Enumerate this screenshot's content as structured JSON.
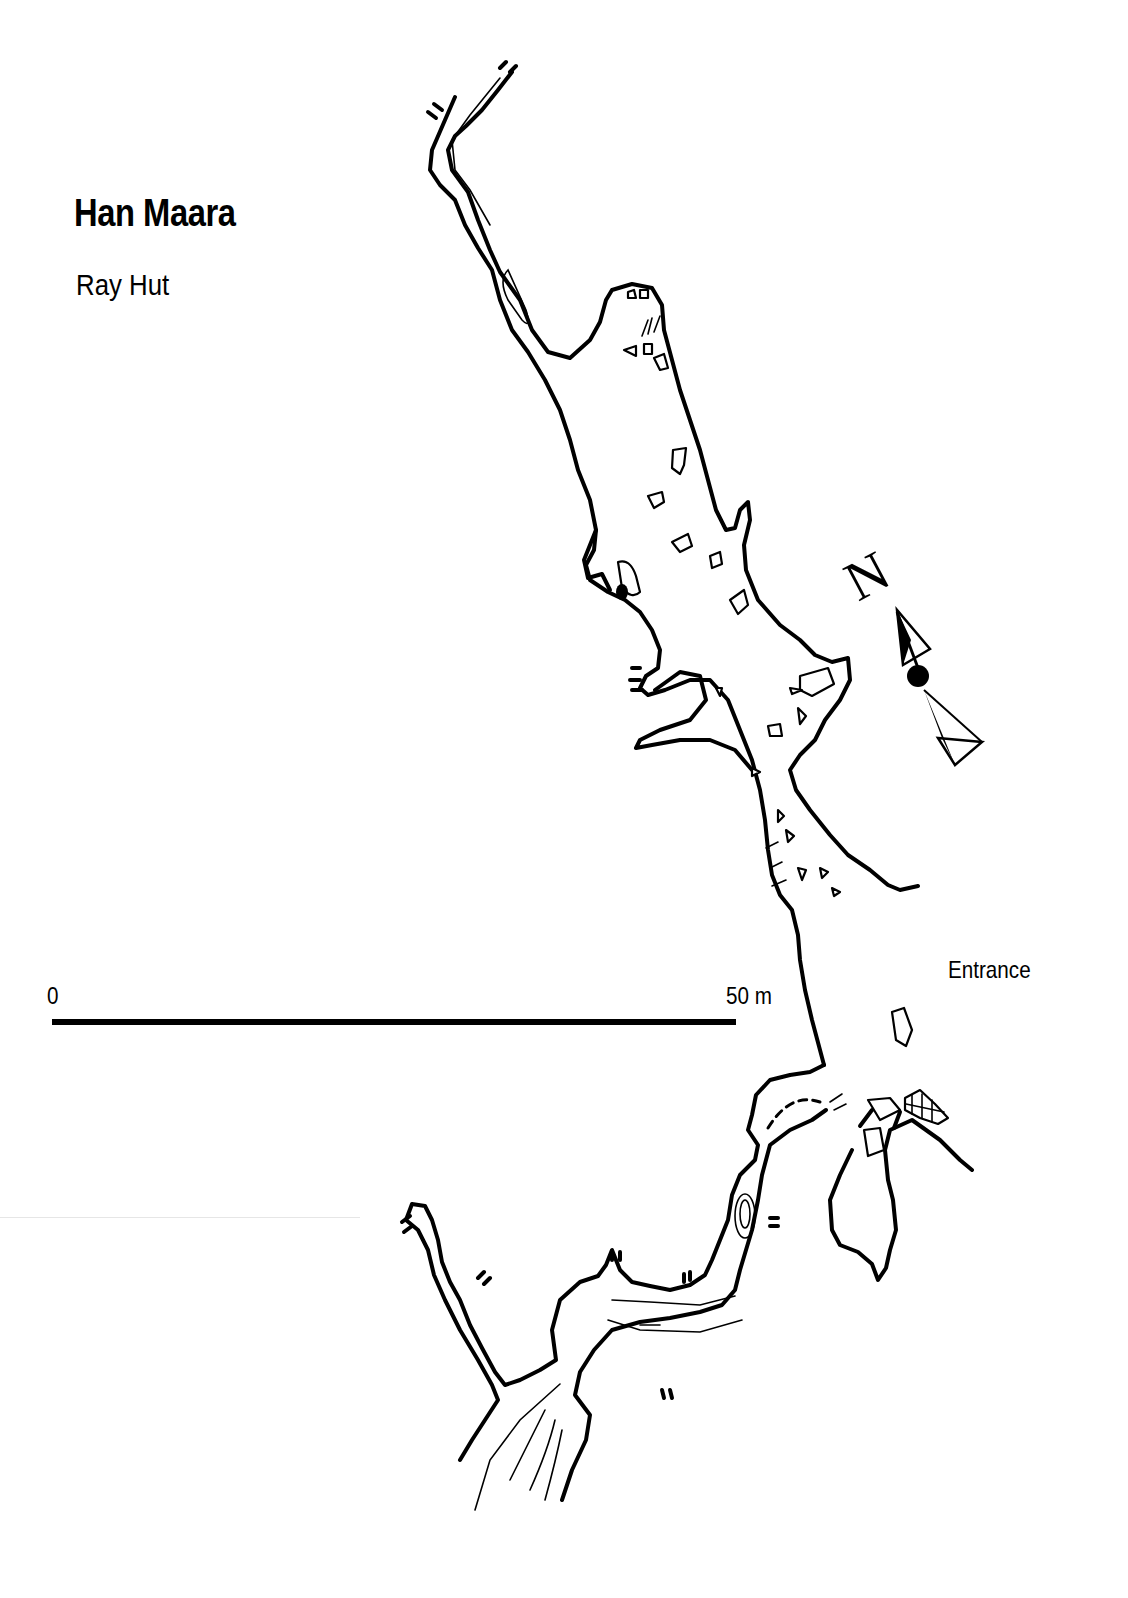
{
  "map": {
    "title": "Han Maara",
    "subtitle": "Ray Hut",
    "scale_bar": {
      "start_label": "0",
      "end_label": "50 m",
      "length_m": 50
    },
    "north_arrow": {
      "label": "N",
      "icon": "north-arrow-icon"
    },
    "annotations": [
      {
        "label": "Entrance"
      }
    ],
    "colors": {
      "ink": "#000000",
      "paper": "#ffffff"
    }
  }
}
